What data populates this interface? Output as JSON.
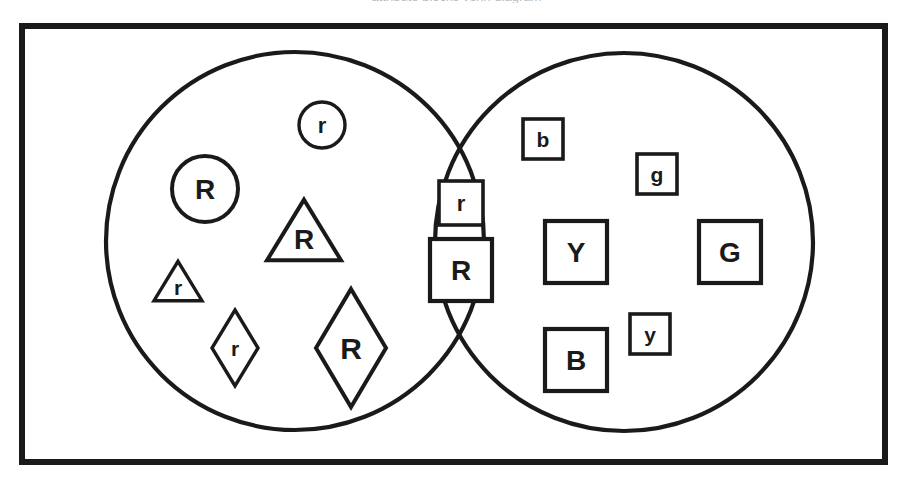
{
  "page": {
    "width": 913,
    "height": 483,
    "background": "#ffffff",
    "stroke_color": "#1a1a1a",
    "fill_color": "#ffffff",
    "cropped_caption": "attribute blocks venn diagram"
  },
  "frame": {
    "x": 22,
    "y": 26,
    "width": 863,
    "height": 436,
    "stroke_width": 6
  },
  "sets": [
    {
      "name": "left-set-red",
      "cx": 295,
      "cy": 241,
      "r": 189,
      "stroke_width": 4.2
    },
    {
      "name": "right-set-squares",
      "cx": 624,
      "cy": 242,
      "r": 189,
      "stroke_width": 4.2
    }
  ],
  "chart_data": {
    "type": "venn",
    "title": "",
    "sets": [
      "left",
      "right"
    ],
    "regions": {
      "left_only": [
        "r",
        "R",
        "R",
        "r",
        "r",
        "R"
      ],
      "intersection": [
        "r",
        "R"
      ],
      "right_only": [
        "b",
        "g",
        "Y",
        "G",
        "y",
        "B"
      ]
    },
    "counts": {
      "left_only": 6,
      "intersection": 2,
      "right_only": 6,
      "total": 14
    }
  },
  "items": [
    {
      "id": "left-circle-small-r",
      "shape": "circle",
      "label": "r",
      "region": "left_only",
      "cx": 322,
      "cy": 125,
      "size": 46,
      "stroke_width": 3.4,
      "font_size": 22
    },
    {
      "id": "left-circle-big-R",
      "shape": "circle",
      "label": "R",
      "region": "left_only",
      "cx": 205,
      "cy": 189,
      "size": 66,
      "stroke_width": 4,
      "font_size": 28
    },
    {
      "id": "left-triangle-big-R",
      "shape": "triangle",
      "label": "R",
      "region": "left_only",
      "cx": 304,
      "cy": 230,
      "size": 74,
      "stroke_width": 4,
      "font_size": 28
    },
    {
      "id": "left-triangle-small-r",
      "shape": "triangle",
      "label": "r",
      "region": "left_only",
      "cx": 178,
      "cy": 281,
      "size": 48,
      "stroke_width": 3.4,
      "font_size": 21
    },
    {
      "id": "left-diamond-small-r",
      "shape": "diamond",
      "label": "r",
      "region": "left_only",
      "cx": 235,
      "cy": 348,
      "size": 46,
      "height": 76,
      "stroke_width": 3.4,
      "font_size": 21
    },
    {
      "id": "left-diamond-big-R",
      "shape": "diamond",
      "label": "R",
      "region": "left_only",
      "cx": 351,
      "cy": 348,
      "size": 70,
      "height": 118,
      "stroke_width": 4,
      "font_size": 30
    },
    {
      "id": "mid-square-small-r",
      "shape": "square",
      "label": "r",
      "region": "intersection",
      "cx": 461,
      "cy": 203,
      "size": 44,
      "stroke_width": 3.6,
      "font_size": 22
    },
    {
      "id": "mid-square-big-R",
      "shape": "square",
      "label": "R",
      "region": "intersection",
      "cx": 461,
      "cy": 270,
      "size": 62,
      "stroke_width": 4.2,
      "font_size": 28
    },
    {
      "id": "right-square-small-b",
      "shape": "square",
      "label": "b",
      "region": "right_only",
      "cx": 543,
      "cy": 139,
      "size": 40,
      "stroke_width": 3.6,
      "font_size": 21
    },
    {
      "id": "right-square-small-g",
      "shape": "square",
      "label": "g",
      "region": "right_only",
      "cx": 657,
      "cy": 174,
      "size": 40,
      "stroke_width": 3.6,
      "font_size": 21
    },
    {
      "id": "right-square-big-Y",
      "shape": "square",
      "label": "Y",
      "region": "right_only",
      "cx": 576,
      "cy": 252,
      "size": 62,
      "stroke_width": 4.2,
      "font_size": 28
    },
    {
      "id": "right-square-big-G",
      "shape": "square",
      "label": "G",
      "region": "right_only",
      "cx": 730,
      "cy": 252,
      "size": 62,
      "stroke_width": 4.2,
      "font_size": 28
    },
    {
      "id": "right-square-small-y",
      "shape": "square",
      "label": "y",
      "region": "right_only",
      "cx": 650,
      "cy": 334,
      "size": 40,
      "stroke_width": 3.6,
      "font_size": 21
    },
    {
      "id": "right-square-big-B",
      "shape": "square",
      "label": "B",
      "region": "right_only",
      "cx": 576,
      "cy": 360,
      "size": 62,
      "stroke_width": 4.2,
      "font_size": 28
    }
  ]
}
